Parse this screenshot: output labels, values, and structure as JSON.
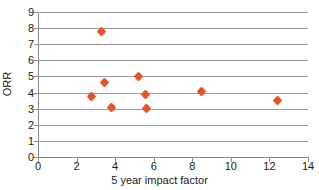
{
  "chart_data": {
    "type": "scatter",
    "title": "",
    "xlabel": "5 year impact factor",
    "ylabel": "ORR",
    "xlim": [
      0,
      14
    ],
    "ylim": [
      0,
      9
    ],
    "xticks": [
      0,
      2,
      4,
      6,
      8,
      10,
      12,
      14
    ],
    "yticks": [
      0,
      1,
      2,
      3,
      4,
      5,
      6,
      7,
      8,
      9
    ],
    "grid": "horizontal",
    "legend": "none",
    "marker_color": "#e4542a",
    "marker_shape": "diamond",
    "points": [
      {
        "x": 3.3,
        "y": 7.8
      },
      {
        "x": 2.75,
        "y": 3.75
      },
      {
        "x": 3.45,
        "y": 4.6
      },
      {
        "x": 3.8,
        "y": 3.05
      },
      {
        "x": 5.2,
        "y": 5.0
      },
      {
        "x": 5.55,
        "y": 3.9
      },
      {
        "x": 5.6,
        "y": 3.0
      },
      {
        "x": 8.5,
        "y": 4.05
      },
      {
        "x": 12.4,
        "y": 3.5
      }
    ]
  }
}
